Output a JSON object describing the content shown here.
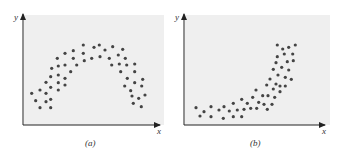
{
  "chart_data": [
    {
      "type": "scatter",
      "panel_label": "(a)",
      "xlabel": "x",
      "ylabel": "y",
      "grid": false,
      "legend": null,
      "description": "Inverted-U (concave down) relationship",
      "background": "#efefef",
      "dot_color": "#444444",
      "points_px": [
        [
          31.7,
          93.3
        ],
        [
          35.7,
          100.7
        ],
        [
          40,
          107.7
        ],
        [
          40,
          90
        ],
        [
          46,
          82.3
        ],
        [
          46,
          93.3
        ],
        [
          46,
          101.7
        ],
        [
          50.7,
          107.7
        ],
        [
          50.7,
          99.3
        ],
        [
          50.7,
          87.3
        ],
        [
          50.7,
          76.7
        ],
        [
          51.7,
          68.3
        ],
        [
          57.3,
          58.3
        ],
        [
          58.3,
          66
        ],
        [
          58.3,
          75
        ],
        [
          58.3,
          82.7
        ],
        [
          58.3,
          90
        ],
        [
          65,
          53.3
        ],
        [
          65,
          65
        ],
        [
          65,
          78.3
        ],
        [
          65,
          85
        ],
        [
          70.7,
          71.7
        ],
        [
          73.3,
          50.7
        ],
        [
          73.3,
          58.3
        ],
        [
          76.7,
          65
        ],
        [
          83.3,
          45
        ],
        [
          83.3,
          53.3
        ],
        [
          84.3,
          60.7
        ],
        [
          91.7,
          58.3
        ],
        [
          94,
          47.3
        ],
        [
          99.3,
          45
        ],
        [
          100,
          56.7
        ],
        [
          105,
          50
        ],
        [
          109.3,
          58.3
        ],
        [
          111.7,
          65
        ],
        [
          112.7,
          46.7
        ],
        [
          118.3,
          55
        ],
        [
          119.3,
          64
        ],
        [
          120.7,
          71.7
        ],
        [
          122.7,
          49.3
        ],
        [
          125.3,
          58.3
        ],
        [
          126.7,
          65
        ],
        [
          127.3,
          78.3
        ],
        [
          124.7,
          86
        ],
        [
          130.7,
          90.7
        ],
        [
          132,
          96
        ],
        [
          133.3,
          103.3
        ],
        [
          134.7,
          64
        ],
        [
          134.7,
          71.7
        ],
        [
          134.7,
          82.7
        ],
        [
          138.7,
          98.3
        ],
        [
          141.3,
          106.7
        ],
        [
          141.7,
          86
        ],
        [
          142.7,
          79.3
        ],
        [
          145,
          95
        ]
      ]
    },
    {
      "type": "scatter",
      "panel_label": "(b)",
      "xlabel": "x",
      "ylabel": "y",
      "grid": false,
      "legend": null,
      "description": "Convex, exponential-like increasing relationship",
      "background": "#efefef",
      "dot_color": "#444444",
      "points_px": [
        [
          196,
          107.7
        ],
        [
          200,
          116
        ],
        [
          204,
          111.7
        ],
        [
          211,
          106.7
        ],
        [
          211,
          116.7
        ],
        [
          219,
          110
        ],
        [
          223.3,
          118.3
        ],
        [
          224,
          106.7
        ],
        [
          229.3,
          111
        ],
        [
          233.3,
          116.7
        ],
        [
          233.3,
          103.3
        ],
        [
          237.3,
          110
        ],
        [
          241.7,
          99.3
        ],
        [
          241.7,
          116.7
        ],
        [
          244,
          109.3
        ],
        [
          247.3,
          103.3
        ],
        [
          250.7,
          108.3
        ],
        [
          252.7,
          97.3
        ],
        [
          256,
          90
        ],
        [
          256.7,
          108.3
        ],
        [
          258.7,
          102.3
        ],
        [
          262.7,
          95.7
        ],
        [
          264,
          104.3
        ],
        [
          267.3,
          109.3
        ],
        [
          268,
          95.7
        ],
        [
          266.7,
          85
        ],
        [
          270,
          79
        ],
        [
          272,
          104.3
        ],
        [
          273.3,
          89
        ],
        [
          274.7,
          97.3
        ],
        [
          273.3,
          69.3
        ],
        [
          276,
          62.7
        ],
        [
          276,
          84
        ],
        [
          278,
          75
        ],
        [
          277.3,
          56.7
        ],
        [
          277.3,
          45
        ],
        [
          280,
          91.7
        ],
        [
          280,
          86
        ],
        [
          281.7,
          67.3
        ],
        [
          282.7,
          49
        ],
        [
          284.3,
          54
        ],
        [
          285.3,
          86
        ],
        [
          285.3,
          77.3
        ],
        [
          287.3,
          61.7
        ],
        [
          288.7,
          70
        ],
        [
          288.7,
          47.3
        ],
        [
          291.3,
          79.3
        ],
        [
          292.7,
          54
        ],
        [
          293.3,
          60.7
        ],
        [
          295.3,
          45
        ]
      ]
    }
  ],
  "labels": {
    "a_caption": "(a)",
    "b_caption": "(b)",
    "a_x": "x",
    "a_y": "y",
    "b_x": "x",
    "b_y": "y"
  }
}
